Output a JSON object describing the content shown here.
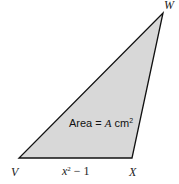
{
  "diagram": {
    "shape": "triangle",
    "fill_color": "#d8d8d8",
    "stroke_color": "#111111",
    "vertices": [
      {
        "label": "V",
        "x": 19,
        "y": 158
      },
      {
        "label": "X",
        "x": 132,
        "y": 158
      },
      {
        "label": "W",
        "x": 163,
        "y": 13
      }
    ],
    "area_label": {
      "prefix": "Area = ",
      "var": "A",
      "unit": " cm",
      "exp": "2"
    },
    "base_label": {
      "var": "x",
      "exp": "2",
      "rest": " − 1"
    }
  }
}
